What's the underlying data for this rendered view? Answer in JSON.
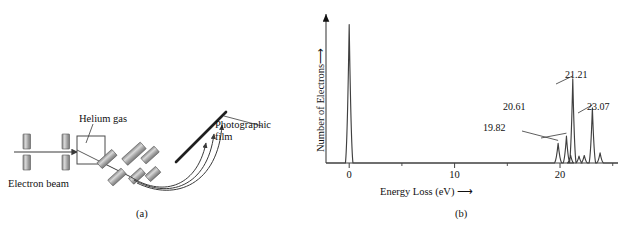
{
  "figure": {
    "panel_a": {
      "caption": "(a)",
      "labels": {
        "helium_gas": "Helium gas",
        "electron_beam": "Electron beam",
        "photographic_film_line1": "Photographic",
        "photographic_film_line2": "film"
      }
    },
    "panel_b": {
      "caption": "(b)"
    }
  },
  "chart_data": {
    "type": "line",
    "title": "",
    "xlabel": "Energy Loss (eV)",
    "ylabel": "Number of Electrons",
    "xlabel_arrow": "⟶",
    "ylabel_arrow": "⟶",
    "xlim": [
      -2.2,
      25.5
    ],
    "ylim": [
      0,
      1.0
    ],
    "grid": false,
    "legend": false,
    "x_major_ticks": [
      0,
      10,
      20
    ],
    "x_major_tick_labels": [
      "0",
      "10",
      "20"
    ],
    "x_minor_ticks": [
      5,
      15,
      25
    ],
    "y_ticks": [],
    "series": [
      {
        "name": "Helium electron energy-loss spectrum",
        "peaks": [
          {
            "x": 0.0,
            "height": 0.955,
            "width": 0.17,
            "labeled": true,
            "label": "0 eV elastic"
          },
          {
            "x": 19.82,
            "height": 0.135,
            "width": 0.16,
            "labeled": true,
            "label": "19.82"
          },
          {
            "x": 20.61,
            "height": 0.185,
            "width": 0.15,
            "labeled": true,
            "label": "20.61"
          },
          {
            "x": 21.0,
            "height": 0.055,
            "width": 0.14,
            "labeled": false,
            "label": ""
          },
          {
            "x": 21.21,
            "height": 0.58,
            "width": 0.15,
            "labeled": true,
            "label": "21.21"
          },
          {
            "x": 21.8,
            "height": 0.048,
            "width": 0.14,
            "labeled": false,
            "label": ""
          },
          {
            "x": 22.3,
            "height": 0.052,
            "width": 0.14,
            "labeled": false,
            "label": ""
          },
          {
            "x": 23.07,
            "height": 0.38,
            "width": 0.15,
            "labeled": true,
            "label": "23.07"
          },
          {
            "x": 23.8,
            "height": 0.07,
            "width": 0.15,
            "labeled": false,
            "label": ""
          }
        ]
      }
    ],
    "annotations": [
      {
        "text": "19.82",
        "peak_x": 19.82
      },
      {
        "text": "20.61",
        "peak_x": 20.61
      },
      {
        "text": "21.21",
        "peak_x": 21.21
      },
      {
        "text": "23.07",
        "peak_x": 23.07
      }
    ],
    "colors": {
      "trace": "#404040",
      "axis": "#404040",
      "text": "#111111"
    }
  }
}
